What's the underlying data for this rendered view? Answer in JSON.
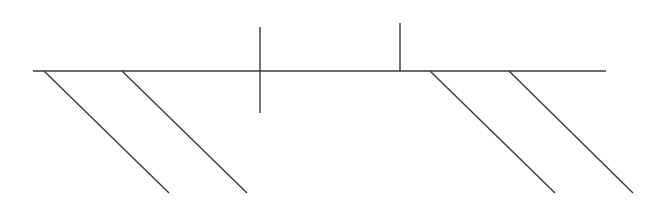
{
  "diagram": {
    "width": 653,
    "height": 202,
    "background": "#ffffff",
    "stroke_color": "#3a3a3a",
    "stroke_width": 1.4,
    "lines": [
      {
        "name": "main-horizontal-line",
        "x1": 33,
        "y1": 71,
        "x2": 606,
        "y2": 71
      },
      {
        "name": "crossing-vertical-line",
        "x1": 260,
        "y1": 27,
        "x2": 260,
        "y2": 113
      },
      {
        "name": "upper-vertical-line",
        "x1": 400,
        "y1": 23,
        "x2": 400,
        "y2": 71
      },
      {
        "name": "diagonal-line-1",
        "x1": 44,
        "y1": 71,
        "x2": 169,
        "y2": 193
      },
      {
        "name": "diagonal-line-2",
        "x1": 122,
        "y1": 71,
        "x2": 247,
        "y2": 193
      },
      {
        "name": "diagonal-line-3",
        "x1": 430,
        "y1": 71,
        "x2": 555,
        "y2": 193
      },
      {
        "name": "diagonal-line-4",
        "x1": 509,
        "y1": 71,
        "x2": 633,
        "y2": 193
      }
    ]
  }
}
